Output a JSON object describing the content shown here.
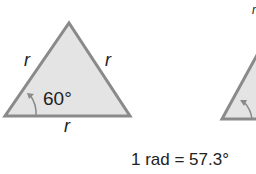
{
  "figure": {
    "left_triangle": {
      "side_labels": [
        "r",
        "r",
        "r"
      ],
      "angle_label": "60°"
    },
    "right_triangle": {
      "side_label_partial": "r"
    },
    "caption": "1 rad = 57.3°"
  },
  "colors": {
    "triangle_fill": "#e4e4e4",
    "triangle_stroke": "#8a8a8a",
    "arc_color": "#8a8a8a",
    "text": "#222222"
  }
}
